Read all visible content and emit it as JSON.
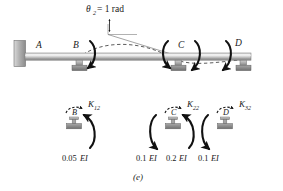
{
  "figure": {
    "caption": "(e)",
    "rotation_label": {
      "symbol": "θ",
      "subscript": "2",
      "equals": "= 1 rad"
    },
    "beam": {
      "nodes": [
        {
          "id": "A",
          "label": "A",
          "support": "fixed-wall"
        },
        {
          "id": "B",
          "label": "B",
          "support": "pin-roller"
        },
        {
          "id": "C",
          "label": "C",
          "support": "pin-roller"
        },
        {
          "id": "D",
          "label": "D",
          "support": "pin-roller"
        }
      ],
      "deflected_shape": "dashed-curve"
    },
    "free_bodies": [
      {
        "node_label": "B",
        "stiffness_symbol": "K",
        "stiffness_subscript": "12",
        "moments": [
          {
            "value": "0.05",
            "unit": "EI"
          }
        ]
      },
      {
        "node_label": "C",
        "stiffness_symbol": "K",
        "stiffness_subscript": "22",
        "moments": [
          {
            "value": "0.1",
            "unit": "EI"
          },
          {
            "value": "0.2",
            "unit": "EI"
          }
        ]
      },
      {
        "node_label": "D",
        "stiffness_symbol": "K",
        "stiffness_subscript": "32",
        "moments": [
          {
            "value": "0.1",
            "unit": "EI"
          }
        ]
      }
    ],
    "moment_values_row": [
      "0.05",
      "0.1",
      "0.2",
      "0.1"
    ],
    "colors": {
      "ink": "#1a1a1a",
      "beam_light": "#e8e8e8",
      "beam_mid": "#b9b9b9",
      "beam_dark": "#8f8f8f",
      "support_fill": "#bdbdbd",
      "hatch_fill": "#9a9a9a",
      "dashed": "#4a4a4a",
      "background": "#ffffff"
    }
  }
}
